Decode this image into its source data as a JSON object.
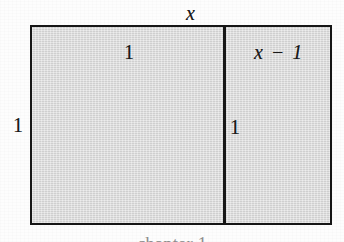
{
  "figure": {
    "type": "geometry-diagram",
    "background_color": "#fdfdfd",
    "fill_color": "#d7d7d7",
    "stroke_color": "#161616",
    "labels": {
      "top_width": "x",
      "left_height": "1",
      "left_cell": "1",
      "right_cell": "x − 1",
      "inner_height": "1"
    },
    "bottom_caption": "chapter 1"
  },
  "chart_data": {
    "type": "diagram",
    "title": "",
    "shapes": [
      {
        "name": "outer-rectangle",
        "kind": "rectangle",
        "x": 30,
        "y": 25,
        "width": 302,
        "height": 200,
        "fill": "#d7d7d7",
        "stroke": "#161616",
        "stroke_width": 2.5,
        "width_label": "x",
        "height_label": "1"
      },
      {
        "name": "left-unit-square",
        "kind": "rectangle",
        "x": 30,
        "y": 25,
        "width": 193,
        "height": 200,
        "width_label": "1",
        "height_label": "1"
      },
      {
        "name": "right-rectangle",
        "kind": "rectangle",
        "x": 223,
        "y": 25,
        "width": 109,
        "height": 200,
        "width_label": "x − 1",
        "height_label": "1"
      },
      {
        "name": "vertical-divider",
        "kind": "line",
        "x1": 222,
        "y1": 25,
        "x2": 222,
        "y2": 225,
        "stroke": "#161616",
        "stroke_width": 2.5
      }
    ],
    "annotations": [
      {
        "text": "x",
        "x": 192,
        "y": 12,
        "style": "italic",
        "role": "overall-width"
      },
      {
        "text": "1",
        "x": 18,
        "y": 124,
        "style": "upright",
        "role": "overall-height"
      },
      {
        "text": "1",
        "x": 129,
        "y": 51,
        "style": "upright",
        "role": "left-cell-width"
      },
      {
        "text": "x − 1",
        "x": 280,
        "y": 51,
        "style": "italic",
        "role": "right-cell-width"
      },
      {
        "text": "1",
        "x": 234,
        "y": 126,
        "style": "upright",
        "role": "right-cell-height"
      }
    ]
  }
}
